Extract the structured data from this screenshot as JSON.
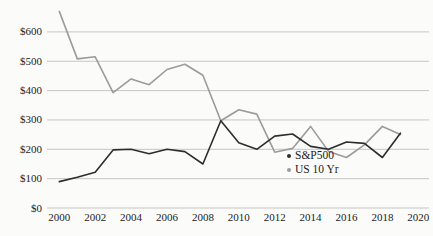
{
  "chart_data": {
    "type": "line",
    "title": "",
    "xlabel": "",
    "ylabel": "",
    "x": [
      2000,
      2001,
      2002,
      2003,
      2004,
      2005,
      2006,
      2007,
      2008,
      2009,
      2010,
      2011,
      2012,
      2013,
      2014,
      2015,
      2016,
      2017,
      2018,
      2019
    ],
    "series": [
      {
        "name": "S&P500",
        "color": "#2d2d2d",
        "values": [
          90,
          105,
          122,
          198,
          200,
          185,
          200,
          192,
          150,
          297,
          222,
          200,
          245,
          252,
          210,
          200,
          225,
          220,
          172,
          255
        ]
      },
      {
        "name": "US 10 Yr",
        "color": "#9b9b9b",
        "values": [
          670,
          508,
          515,
          393,
          440,
          420,
          472,
          490,
          452,
          297,
          335,
          320,
          190,
          203,
          278,
          193,
          172,
          215,
          278,
          250
        ]
      }
    ],
    "x_ticks": [
      2000,
      2002,
      2004,
      2006,
      2008,
      2010,
      2012,
      2014,
      2016,
      2018,
      2020
    ],
    "y_tick_values": [
      0,
      100,
      200,
      300,
      400,
      500,
      600
    ],
    "y_tick_labels": [
      "$0",
      "$100",
      "$200",
      "$300",
      "$400",
      "$500",
      "$600"
    ],
    "xlim": [
      2000,
      2020
    ],
    "ylim": [
      0,
      680
    ],
    "grid": "horizontal",
    "gridline_color": "#c6c6c4",
    "legend_position": "inside-right"
  }
}
